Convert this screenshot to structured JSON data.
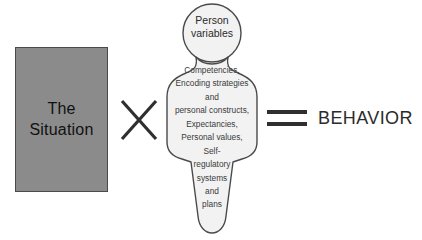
{
  "diagram": {
    "type": "formula-diagram",
    "background_color": "#ffffff",
    "equation_reading": "The Situation × Person variables = BEHAVIOR"
  },
  "situation": {
    "label": "The\nSituation",
    "fill_color": "#8b8b8b",
    "border_color": "#4a4a4a",
    "text_color": "#111111"
  },
  "operators": {
    "multiply": "×",
    "equals": "="
  },
  "person": {
    "head_label": "Person\nvariables",
    "body_label": "Competencies,\nEncoding strategies\nand\npersonal constructs,\nExpectancies,\nPersonal values,\nSelf-\nregulatory\nsystems\nand\nplans",
    "body_items": [
      "Competencies,",
      "Encoding strategies",
      "and",
      "personal constructs,",
      "Expectancies,",
      "Personal values,",
      "Self-",
      "regulatory",
      "systems",
      "and",
      "plans"
    ],
    "fill_color": "#f2f2f2",
    "outline_color": "#4a4a4a",
    "text_color": "#3a3a3a"
  },
  "result": {
    "label": "BEHAVIOR",
    "text_color": "#2b2b2b"
  }
}
